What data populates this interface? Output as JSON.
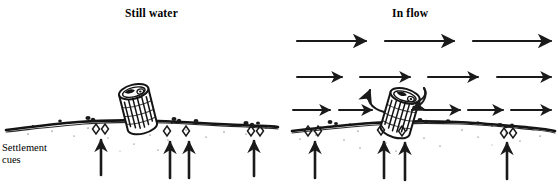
{
  "figure": {
    "type": "scientific-line-drawing",
    "panels": [
      {
        "id": "still-water",
        "title": "Still water"
      },
      {
        "id": "in-flow",
        "title": "In flow"
      }
    ],
    "annotation": {
      "settlement_cues_line1": "Settlement",
      "settlement_cues_line2": "cues"
    },
    "colors": {
      "ink": "#1a1a1a",
      "background": "#ffffff",
      "substrate": "#141414"
    },
    "elements": {
      "larva_case_still": "caddisfly-larva-case",
      "larva_case_flow": "caddisfly-larva-case",
      "flow_arrow_rows": 3,
      "flow_arrows_row1": 3,
      "flow_arrows_row2": 4,
      "flow_arrows_row3": 6,
      "cue_arrows_still": 3,
      "cue_arrows_flow": 4,
      "turbulence_arrows": 2
    }
  }
}
